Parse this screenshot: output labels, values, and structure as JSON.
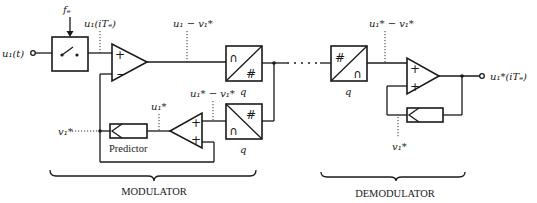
{
  "diagram": {
    "sections": {
      "modulator_label": "MODULATOR",
      "demodulator_label": "DEMODULATOR"
    },
    "signals": {
      "input": "u₁(t)",
      "sampling_freq": "fₑ",
      "sampled": "u₁(iTₑ)",
      "error": "u₁ − v₁*",
      "quantized_error": "u₁* − v₁*",
      "reconstructed": "u₁*",
      "prediction": "v₁*",
      "demod_error": "u₁* − v₁*",
      "demod_prediction": "v₁*",
      "output": "u₁*(iTₑ)"
    },
    "blocks": {
      "sampler": "sampler switch",
      "predictor_label": "Predictor",
      "quantizer_label": "q",
      "encoder_label": "q",
      "decoder_label": "q",
      "demod_decoder_label": "q",
      "analog_symbol": "∩",
      "digital_symbol": "#"
    },
    "summer_signs": {
      "mod_subtractor": [
        "+",
        "−"
      ],
      "mod_adder": [
        "+",
        "+"
      ],
      "demod_adder": [
        "+",
        "+"
      ]
    }
  }
}
